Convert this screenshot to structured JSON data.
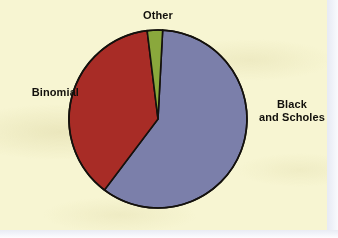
{
  "chart_data": {
    "type": "pie",
    "title": "",
    "subtitle": "",
    "categories": [
      "Black and Scholes",
      "Binomial",
      "Other"
    ],
    "values": [
      59,
      38,
      3
    ],
    "labels": [
      "Black\nand Scholes",
      "Binomial",
      "Other"
    ],
    "colors": [
      "#7b7faa",
      "#a82c26",
      "#8aa83c"
    ],
    "legend": "none",
    "grid": false,
    "xlabel": "",
    "ylabel": "",
    "annotations": [],
    "slices": [
      {
        "name": "Black and Scholes",
        "label_line_1": "Black",
        "label_line_2": "and Scholes",
        "value": 59,
        "color": "#7b7faa",
        "start_angle_deg": 3,
        "end_angle_deg": 217
      },
      {
        "name": "Binomial",
        "label_line_1": "Binomial",
        "label_line_2": "",
        "value": 38,
        "color": "#a82c26",
        "start_angle_deg": 217,
        "end_angle_deg": 353
      },
      {
        "name": "Other",
        "label_line_1": "Other",
        "label_line_2": "",
        "value": 3,
        "color": "#8aa83c",
        "start_angle_deg": 353,
        "end_angle_deg": 363
      }
    ]
  },
  "labels": {
    "other": "Other",
    "binomial": "Binomial",
    "black_line_1": "Black",
    "black_line_2": "and Scholes"
  },
  "colors": {
    "background": "#f7f5d2",
    "slice_black_scholes": "#7b7faa",
    "slice_binomial": "#a82c26",
    "slice_other": "#8aa83c",
    "outline": "#14110d",
    "text": "#12100c",
    "page_edge": "#e9ecf4"
  },
  "geometry": {
    "center_x": 158,
    "center_y": 119,
    "radius": 89
  }
}
